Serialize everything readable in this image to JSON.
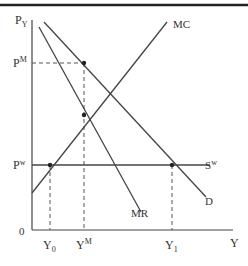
{
  "diagram": {
    "axes": {
      "y_label": "P",
      "y_label_sub": "Y",
      "x_label": "Y",
      "origin": "0"
    },
    "price_labels": {
      "pm": "P",
      "pm_sup": "M",
      "pw": "P",
      "pw_sup": "w"
    },
    "quantity_labels": {
      "y0": "Y",
      "y0_sub": "0",
      "ym": "Y",
      "ym_sup": "M",
      "y1": "Y",
      "y1_sub": "1"
    },
    "curves": {
      "mc": "MC",
      "mr": "MR",
      "d": "D",
      "sw": "S",
      "sw_sup": "w"
    },
    "colors": {
      "line": "#444444",
      "border": "#222222",
      "text": "#333333"
    }
  }
}
